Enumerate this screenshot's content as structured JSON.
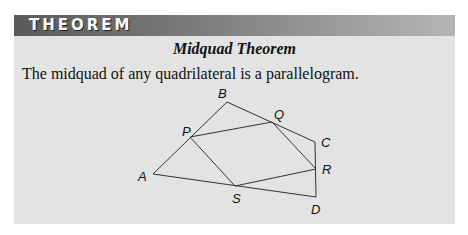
{
  "header": {
    "label": "THEOREM"
  },
  "theorem": {
    "title": "Midquad Theorem",
    "statement": "The midquad of any quadrilateral is a parallelogram."
  },
  "figure": {
    "labels": {
      "A": "A",
      "B": "B",
      "C": "C",
      "D": "D",
      "P": "P",
      "Q": "Q",
      "R": "R",
      "S": "S"
    },
    "line_color": "#333333"
  },
  "colors": {
    "panel_bg": "#e3e3e3",
    "header_dark": "#5a5a5a",
    "header_light": "#b5b5b5"
  }
}
